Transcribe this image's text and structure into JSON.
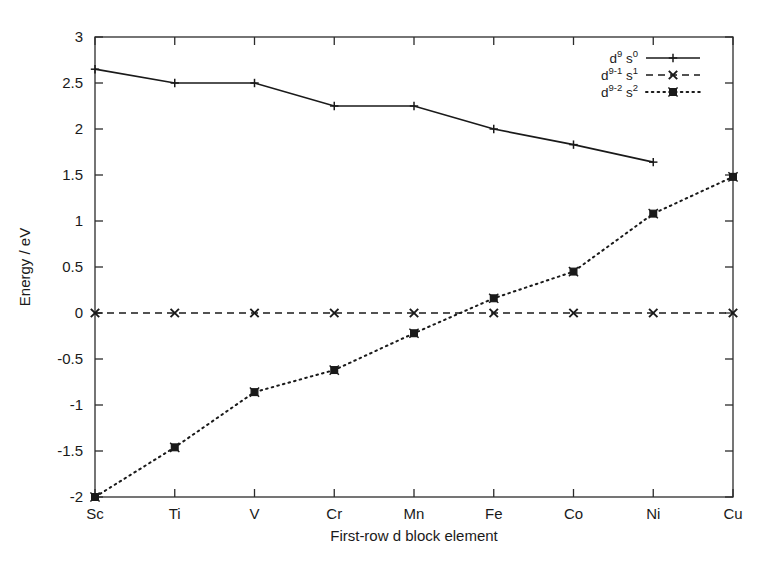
{
  "chart_data": {
    "type": "line",
    "title": "",
    "xlabel": "First-row d block element",
    "ylabel": "Energy / eV",
    "categories": [
      "Sc",
      "Ti",
      "V",
      "Cr",
      "Mn",
      "Fe",
      "Co",
      "Ni",
      "Cu"
    ],
    "ylim": [
      -2,
      3
    ],
    "yticks": [
      -2,
      -1.5,
      -1,
      -0.5,
      0,
      0.5,
      1,
      1.5,
      2,
      2.5,
      3
    ],
    "ytick_labels": [
      "-2",
      "-1.5",
      "-1",
      "-0.5",
      "0",
      "0.5",
      "1",
      "1.5",
      "2",
      "2.5",
      "3"
    ],
    "grid": false,
    "legend_position": "top-right-inside",
    "series": [
      {
        "name": "d9s0",
        "label_base": "d",
        "label_sup1": "9",
        "label_mid": "s",
        "label_sup2": "0",
        "line_style": "solid",
        "marker": "plus",
        "color": "#1a1a1a",
        "values": [
          2.65,
          2.5,
          2.5,
          2.25,
          2.25,
          2.0,
          1.83,
          1.64,
          null
        ]
      },
      {
        "name": "d9-1s1",
        "label_base": "d",
        "label_sup1": "9-1",
        "label_mid": "s",
        "label_sup2": "1",
        "line_style": "dashed",
        "marker": "cross",
        "color": "#1a1a1a",
        "values": [
          0,
          0,
          0,
          0,
          0,
          0,
          0,
          0,
          0
        ]
      },
      {
        "name": "d9-2s2",
        "label_base": "d",
        "label_sup1": "9-2",
        "label_mid": "s",
        "label_sup2": "2",
        "line_style": "dotted",
        "marker": "square",
        "color": "#1a1a1a",
        "values": [
          -2.0,
          -1.46,
          -0.86,
          -0.62,
          -0.22,
          0.16,
          0.45,
          1.08,
          1.48
        ]
      }
    ]
  },
  "axes": {
    "y_title": "Energy / eV",
    "x_title": "First-row d block element"
  },
  "legend": {
    "entries": [
      {
        "base": "d",
        "sup1": "9",
        "mid": "s",
        "sup2": "0"
      },
      {
        "base": "d",
        "sup1": "9-1",
        "mid": "s",
        "sup2": "1"
      },
      {
        "base": "d",
        "sup1": "9-2",
        "mid": "s",
        "sup2": "2"
      }
    ]
  }
}
